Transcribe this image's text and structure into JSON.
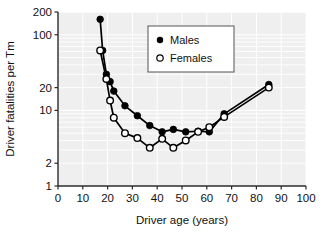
{
  "chart_data": {
    "type": "line",
    "title": "",
    "xlabel": "Driver age (years)",
    "ylabel": "Driver fatalities per Tm",
    "xlim": [
      0,
      100
    ],
    "ylim": [
      1,
      200
    ],
    "yscale": "log",
    "xscale": "linear",
    "grid": true,
    "grid_color": "#ffffff",
    "plot_background": "#efefef",
    "legend_position": "upper-center",
    "xticks": [
      0,
      10,
      20,
      30,
      40,
      50,
      60,
      70,
      80,
      90,
      100
    ],
    "xtick_labels": [
      "0",
      "10",
      "20",
      "30",
      "40",
      "50",
      "60",
      "70",
      "80",
      "90",
      "100"
    ],
    "yticks": [
      1,
      2,
      10,
      20,
      100,
      200
    ],
    "ytick_labels": [
      "1",
      "2",
      "10",
      "20",
      "100",
      "200"
    ],
    "series": [
      {
        "name": "Males",
        "marker": "filled-circle",
        "color": "#000000",
        "x": [
          17,
          18,
          19.5,
          21,
          22.5,
          27,
          32,
          37,
          42,
          46.5,
          51.5,
          56.5,
          61,
          67,
          85
        ],
        "y": [
          160,
          62,
          30,
          24,
          18,
          11.5,
          8.5,
          6.3,
          5.2,
          5.6,
          5.2,
          5.3,
          5.2,
          9.0,
          22
        ]
      },
      {
        "name": "Females",
        "marker": "open-circle",
        "color": "#000000",
        "x": [
          17,
          19.5,
          21,
          22.5,
          27,
          32,
          37,
          42,
          46.5,
          51.5,
          56.5,
          61,
          67,
          85
        ],
        "y": [
          62,
          26,
          13.5,
          8.0,
          5.0,
          4.3,
          3.2,
          4.2,
          3.2,
          4.0,
          5.2,
          6.0,
          8.2,
          20
        ]
      }
    ]
  },
  "legend": {
    "entries": [
      {
        "label": "Males",
        "marker": "filled-circle"
      },
      {
        "label": "Females",
        "marker": "open-circle"
      }
    ]
  },
  "axes": {
    "x_title": "Driver age (years)",
    "y_title": "Driver fatalities per Tm"
  }
}
